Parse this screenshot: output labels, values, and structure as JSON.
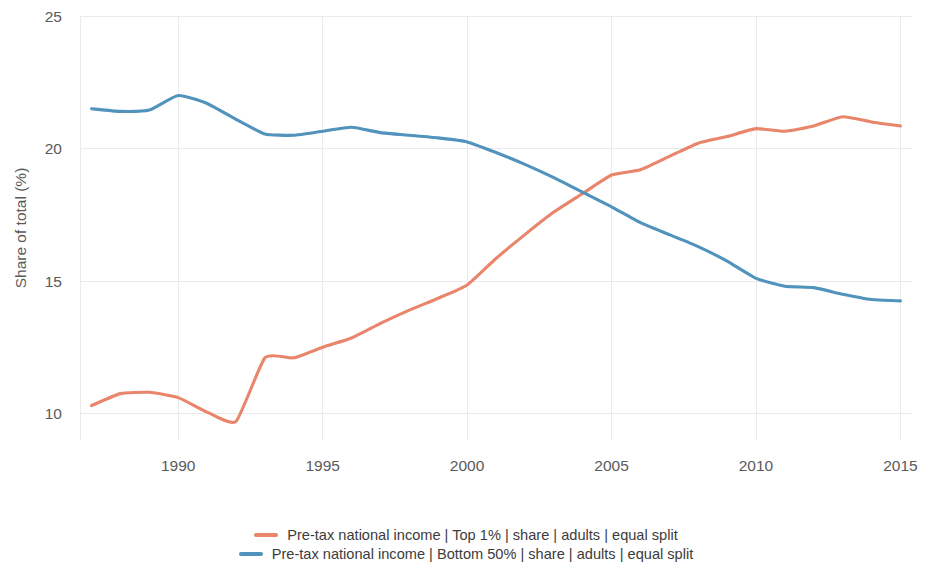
{
  "chart_data": {
    "type": "line",
    "title": "",
    "subtitle": "",
    "xlabel": "",
    "ylabel": "Share of total (%)",
    "xlim": [
      1986.6,
      2015.4
    ],
    "ylim": [
      9.0,
      25.0
    ],
    "xticks": [
      "1990",
      "1995",
      "2000",
      "2005",
      "2010",
      "2015"
    ],
    "xtick_values": [
      1990,
      1995,
      2000,
      2005,
      2010,
      2015
    ],
    "yticks": [
      "10",
      "15",
      "20",
      "25"
    ],
    "ytick_values": [
      10,
      15,
      20,
      25
    ],
    "grid": true,
    "legend_position": "bottom-center",
    "x": [
      1987,
      1988,
      1989,
      1990,
      1991,
      1992,
      1993,
      1994,
      1995,
      1996,
      1997,
      1998,
      1999,
      2000,
      2001,
      2002,
      2003,
      2004,
      2005,
      2006,
      2007,
      2008,
      2009,
      2010,
      2011,
      2012,
      2013,
      2014,
      2015
    ],
    "series": [
      {
        "name": "Pre-tax national income | Top 1% | share | adults | equal split",
        "short_name": "Top 1%",
        "color": "#e8856a",
        "values": [
          10.3,
          10.75,
          10.8,
          10.6,
          10.05,
          9.7,
          12.1,
          12.1,
          12.5,
          12.85,
          13.4,
          13.9,
          14.35,
          14.85,
          15.85,
          16.75,
          17.6,
          18.3,
          19.0,
          19.2,
          19.7,
          20.2,
          20.45,
          20.75,
          20.65,
          20.85,
          21.2,
          21.0,
          20.85
        ]
      },
      {
        "name": "Pre-tax national income | Bottom 50% | share | adults | equal split",
        "short_name": "Bottom 50%",
        "color": "#5193bd",
        "values": [
          21.5,
          21.4,
          21.45,
          22.0,
          21.7,
          21.1,
          20.55,
          20.5,
          20.65,
          20.8,
          20.6,
          20.5,
          20.4,
          20.25,
          19.85,
          19.4,
          18.9,
          18.35,
          17.8,
          17.2,
          16.75,
          16.3,
          15.75,
          15.1,
          14.8,
          14.75,
          14.5,
          14.3,
          14.25
        ]
      }
    ]
  },
  "axis": {
    "y_title": "Share of total (%)"
  },
  "legend": {
    "items": [
      {
        "label": "Pre-tax national income | Top 1% | share | adults | equal split",
        "color": "#e8856a"
      },
      {
        "label": "Pre-tax national income | Bottom 50% | share | adults | equal split",
        "color": "#5193bd"
      }
    ]
  },
  "colors": {
    "top1_line": "#e8856a",
    "bottom50_line": "#5193bd",
    "grid": "#e9e9ee",
    "tick_text": "#5a5a5a",
    "legend_text": "#3c3c3c",
    "background": "#ffffff"
  }
}
